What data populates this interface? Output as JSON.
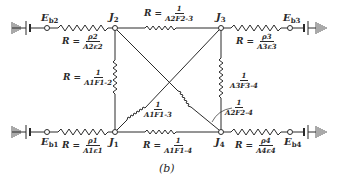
{
  "diagram": {
    "caption": "(b)",
    "nodes": {
      "J1": {
        "label": "J",
        "sub": "1"
      },
      "J2": {
        "label": "J",
        "sub": "2"
      },
      "J3": {
        "label": "J",
        "sub": "3"
      },
      "J4": {
        "label": "J",
        "sub": "4"
      }
    },
    "sources": {
      "Eb1": {
        "label": "E",
        "sub": "b1"
      },
      "Eb2": {
        "label": "E",
        "sub": "b2"
      },
      "Eb3": {
        "label": "E",
        "sub": "b3"
      },
      "Eb4": {
        "label": "E",
        "sub": "b4"
      }
    },
    "resistances": {
      "surface_2": {
        "prefix": "R =",
        "num": "ρ2",
        "den": "A2ε2"
      },
      "surface_3": {
        "prefix": "R =",
        "num": "ρ3",
        "den": "A3ε3"
      },
      "surface_1": {
        "prefix": "R =",
        "num": "ρ1",
        "den": "A1ε1"
      },
      "surface_4": {
        "prefix": "R =",
        "num": "ρ4",
        "den": "A4ε4"
      },
      "space_2_3": {
        "prefix": "R =",
        "num": "1",
        "den": "A2F2-3"
      },
      "space_1_2": {
        "prefix": "R =",
        "num": "1",
        "den": "A1F1-2"
      },
      "space_3_4": {
        "prefix": "",
        "num": "1",
        "den": "A3F3-4"
      },
      "space_1_3": {
        "prefix": "",
        "num": "1",
        "den": "A1F1-3"
      },
      "space_2_4": {
        "prefix": "",
        "num": "1",
        "den": "A2F2-4"
      },
      "space_1_4": {
        "prefix": "R =",
        "num": "1",
        "den": "A1F1-4"
      }
    },
    "colors": {
      "line": "#2a2a2a",
      "background": "#ffffff"
    }
  }
}
